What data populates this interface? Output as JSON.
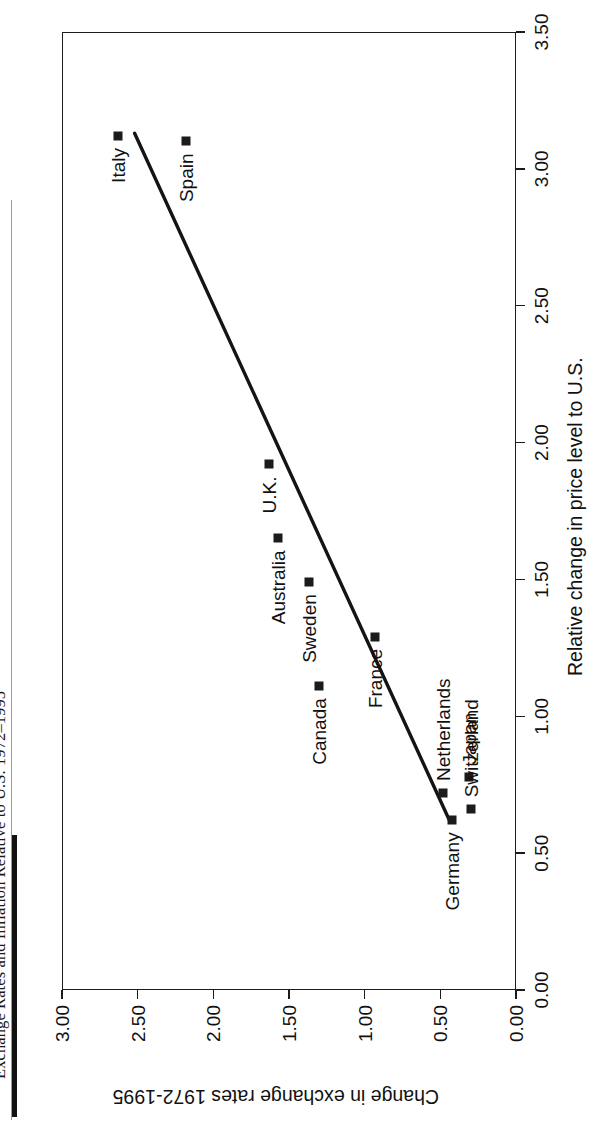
{
  "document": {
    "title": "Exchange Rates and Inflation Relative to U.S. 1972–1995"
  },
  "chart_data": {
    "type": "scatter",
    "title": "Exchange Rates and Inflation Relative to U.S. 1972–1995",
    "xlabel": "Relative change in price level to U.S.",
    "ylabel": "Change in  exchange rates  1972-1995",
    "xlim": [
      0.0,
      3.5
    ],
    "ylim": [
      0.0,
      3.0
    ],
    "grid": false,
    "legend": "none",
    "xticks": [
      "0.00",
      "0.50",
      "1.00",
      "1.50",
      "2.00",
      "2.50",
      "3.00",
      "3.50"
    ],
    "yticks": [
      "0.00",
      "0.50",
      "1.00",
      "1.50",
      "2.00",
      "2.50",
      "3.00"
    ],
    "points": [
      {
        "label": "Italy",
        "x": 3.12,
        "y": 2.63,
        "label_pos": "left"
      },
      {
        "label": "Spain",
        "x": 3.1,
        "y": 2.18,
        "label_pos": "left"
      },
      {
        "label": "U.K.",
        "x": 1.92,
        "y": 1.63,
        "label_pos": "left"
      },
      {
        "label": "Australia",
        "x": 1.65,
        "y": 1.57,
        "label_pos": "left"
      },
      {
        "label": "Sweden",
        "x": 1.49,
        "y": 1.37,
        "label_pos": "left"
      },
      {
        "label": "France",
        "x": 1.29,
        "y": 0.93,
        "label_pos": "left"
      },
      {
        "label": "Canada",
        "x": 1.11,
        "y": 1.3,
        "label_pos": "left"
      },
      {
        "label": "Netherlands",
        "x": 0.72,
        "y": 0.48,
        "label_pos": "right"
      },
      {
        "label": "Japan",
        "x": 0.78,
        "y": 0.31,
        "label_pos": "right"
      },
      {
        "label": "Germany",
        "x": 0.62,
        "y": 0.42,
        "label_pos": "left"
      },
      {
        "label": "Switzerland",
        "x": 0.66,
        "y": 0.3,
        "label_pos": "right"
      }
    ],
    "trendline": {
      "x_start": 3.13,
      "y_start": 2.52,
      "x_end": 0.62,
      "y_end": 0.44
    }
  },
  "axes": {
    "x_title": "Relative change in price level to U.S.",
    "y_title": "Change in  exchange rates  1972-1995"
  }
}
